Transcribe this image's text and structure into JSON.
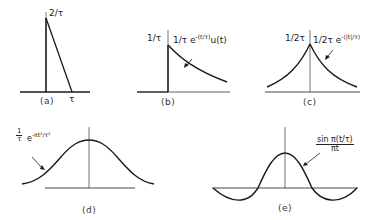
{
  "figure": {
    "panels": [
      {
        "id": "a",
        "caption": "(a)",
        "shape": "triangular pulse",
        "peak_label": "2/τ",
        "x_label": "τ"
      },
      {
        "id": "b",
        "caption": "(b)",
        "shape": "one-sided exponential",
        "peak_label": "1/τ",
        "curve_label_base": "1/τ e",
        "curve_label_exp": "-(t/τ)",
        "curve_label_tail": "u(t)"
      },
      {
        "id": "c",
        "caption": "(c)",
        "shape": "two-sided exponential",
        "peak_label": "1/2τ",
        "curve_label_base": "1/2τ e",
        "curve_label_exp": "-(|t|/τ)"
      },
      {
        "id": "d",
        "caption": "(d)",
        "shape": "gaussian",
        "curve_label_coef_num": "1",
        "curve_label_coef_den": "τ",
        "curve_label_base": "e",
        "curve_label_exp": "-πt²/τ²"
      },
      {
        "id": "e",
        "caption": "(e)",
        "shape": "sinc",
        "curve_label_num": "sin π(t/τ)",
        "curve_label_den": "πt"
      }
    ],
    "line_color": "#1a1a1a"
  }
}
